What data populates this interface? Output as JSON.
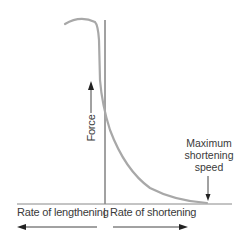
{
  "diagram": {
    "y_axis_label": "Force",
    "x_axis_left_label": "Rate of lengthening",
    "x_axis_separator": "|",
    "x_axis_right_label": "Rate of shortening",
    "annotation": {
      "line1": "Maximum",
      "line2": "shortening",
      "line3": "speed"
    },
    "colors": {
      "curve": "#a8a8a8",
      "axis": "#444444",
      "text": "#3a3a3a"
    }
  }
}
